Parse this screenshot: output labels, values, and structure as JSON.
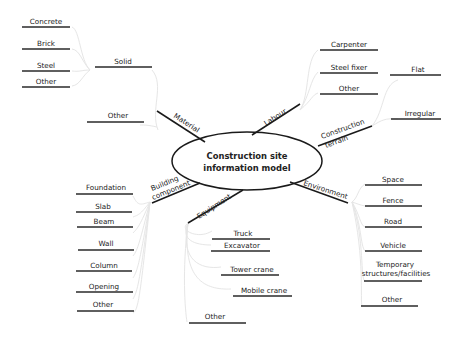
{
  "center": {
    "line1": "Construction site",
    "line2": "information model"
  },
  "branches": {
    "material": {
      "label": "Material",
      "sub": {
        "solid": {
          "label": "Solid",
          "items": [
            "Concrete",
            "Brick",
            "Steel",
            "Other"
          ]
        },
        "other": {
          "label": "Other"
        }
      }
    },
    "labour": {
      "label": "Labour",
      "items": [
        "Carpenter",
        "Steel fixer",
        "Other"
      ]
    },
    "terrain": {
      "line1": "Construction",
      "line2": "terrain",
      "items": [
        "Flat",
        "Irregular"
      ]
    },
    "environment": {
      "label": "Environment",
      "items": [
        "Space",
        "Fence",
        "Road",
        "Vehicle",
        "Temporary",
        "structures/facilities",
        "Other"
      ]
    },
    "equipment": {
      "label": "Equipment",
      "items": [
        "Truck",
        "Excavator",
        "Tower crane",
        "Mobile crane",
        "Other"
      ]
    },
    "building": {
      "line1": "Building",
      "line2": "component",
      "items": [
        "Foundation",
        "Slab",
        "Beam",
        "Wall",
        "Column",
        "Opening",
        "Other"
      ]
    }
  },
  "colors": {
    "line": "#1a1a1a",
    "connector": "#e6e6e6",
    "text": "#222222",
    "background": "#ffffff"
  }
}
